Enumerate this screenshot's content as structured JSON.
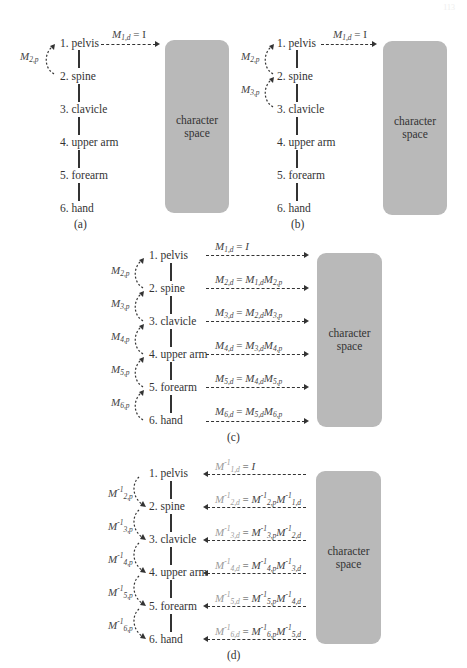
{
  "page_number": "113",
  "joints": [
    "1. pelvis",
    "2. spine",
    "3. clavicle",
    "4. upper arm",
    "5. forearm",
    "6. hand"
  ],
  "box_label_line1": "character",
  "box_label_line2": "space",
  "panels": {
    "a": {
      "caption": "(a)",
      "local_labels": [
        {
          "base": "M",
          "sub": "2,p",
          "sup": ""
        }
      ],
      "transforms": [
        {
          "lhs": "M",
          "lhs_sub": "1,d",
          "rhs": " = I"
        }
      ]
    },
    "b": {
      "caption": "(b)",
      "local_labels": [
        {
          "base": "M",
          "sub": "2,p",
          "sup": ""
        },
        {
          "base": "M",
          "sub": "3,p",
          "sup": ""
        }
      ],
      "transforms": [
        {
          "lhs": "M",
          "lhs_sub": "1,d",
          "rhs": " = I"
        }
      ]
    },
    "c": {
      "caption": "(c)",
      "local_labels": [
        {
          "base": "M",
          "sub": "2,p"
        },
        {
          "base": "M",
          "sub": "3,p"
        },
        {
          "base": "M",
          "sub": "4,p"
        },
        {
          "base": "M",
          "sub": "5,p"
        },
        {
          "base": "M",
          "sub": "6,p"
        }
      ],
      "transforms": [
        {
          "text": "M1,d = I"
        },
        {
          "text": "M2,d = M1,d M2,p"
        },
        {
          "text": "M3,d = M2,d M3,p"
        },
        {
          "text": "M4,d = M3,d M4,p"
        },
        {
          "text": "M5,d = M4,d M5,p"
        },
        {
          "text": "M6,d = M5,d M6,p"
        }
      ]
    },
    "d": {
      "caption": "(d)",
      "local_labels": [
        {
          "base": "M",
          "sub": "2,p",
          "sup": "-1"
        },
        {
          "base": "M",
          "sub": "3,p",
          "sup": "-1"
        },
        {
          "base": "M",
          "sub": "4,p",
          "sup": "-1"
        },
        {
          "base": "M",
          "sub": "5,p",
          "sup": "-1"
        },
        {
          "base": "M",
          "sub": "6,p",
          "sup": "-1"
        }
      ],
      "transforms": [
        {
          "text": "M1,d^-1 = I"
        },
        {
          "text": "M2,d^-1 = M2,p^-1 M1,d^-1"
        },
        {
          "text": "M3,d^-1 = M3,p^-1 M2,d^-1"
        },
        {
          "text": "M4,d^-1 = M4,p^-1 M3,d^-1"
        },
        {
          "text": "M5,d^-1 = M5,p^-1 M4,d^-1"
        },
        {
          "text": "M6,d^-1 = M6,p^-1 M5,d^-1"
        }
      ]
    }
  },
  "colors": {
    "box_fill": "#b9b9b9",
    "line": "#333333",
    "faded_math": "#9a9a9a"
  }
}
